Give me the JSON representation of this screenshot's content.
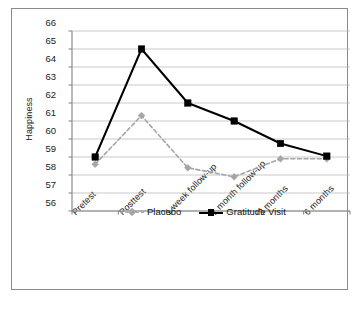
{
  "chart_data": {
    "type": "line",
    "title": "",
    "xlabel": "",
    "ylabel": "Happiness",
    "ylim": [
      56,
      66
    ],
    "ytick_step": 1,
    "yticks": [
      66,
      65,
      64,
      63,
      62,
      61,
      60,
      59,
      58,
      57,
      56
    ],
    "grid": true,
    "grid_axis": "y",
    "legend_position": "inside-bottom-center",
    "categories": [
      "Pretest",
      "Posttest",
      "1 week follow-up",
      "1 month follow-up",
      "3 months",
      "6 months"
    ],
    "series": [
      {
        "name": "Placebo",
        "color": "#a6a6a6",
        "marker": "diamond",
        "linestyle": "dashed",
        "values": [
          58.6,
          61.3,
          58.4,
          57.9,
          58.9,
          58.9
        ]
      },
      {
        "name": "Gratitude Visit",
        "color": "#000000",
        "marker": "square",
        "linestyle": "solid",
        "values": [
          59.0,
          65.0,
          62.0,
          61.0,
          59.75,
          59.05
        ]
      }
    ]
  },
  "axes": {
    "y_title": "Happiness"
  },
  "colors": {
    "frame": "#8a8a8a",
    "gridline": "#b3b3b3",
    "axis": "#808080",
    "placebo": "#a6a6a6",
    "gratitude": "#000000",
    "background": "#ffffff"
  }
}
